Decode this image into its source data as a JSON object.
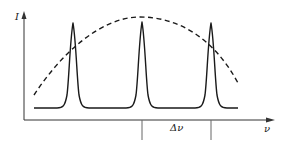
{
  "diagram": {
    "title": "",
    "labels": {
      "y_axis": "I",
      "x_axis": "ν",
      "spacing": "Δν"
    },
    "axes": {
      "origin": [
        24,
        120
      ],
      "y_axis_top": [
        24,
        12
      ],
      "x_axis_right": [
        274,
        120
      ]
    },
    "baseline": {
      "y": 108,
      "x_start": 34,
      "x_end": 238
    },
    "peaks": [
      {
        "x": 73,
        "top_y": 23
      },
      {
        "x": 142,
        "top_y": 22
      },
      {
        "x": 211,
        "top_y": 23
      }
    ],
    "envelope": {
      "style": "dashed",
      "start": [
        34,
        95
      ],
      "apex": [
        140,
        17
      ],
      "end": [
        238,
        83
      ]
    },
    "spacing_marker": {
      "tick_x": [
        142,
        211
      ],
      "tick_y": [
        120,
        140
      ],
      "label_pos": [
        176,
        131
      ]
    },
    "colors": {
      "curve": "#1a1a1a",
      "axis": "#333333",
      "tick": "#666666",
      "background": "#ffffff"
    }
  }
}
